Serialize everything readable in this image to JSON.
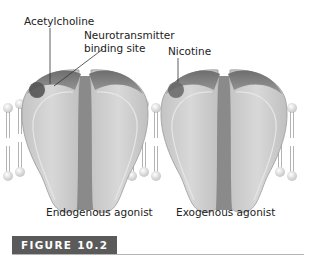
{
  "labels": {
    "acetylcholine": "Acetylcholine",
    "binding_site_line1": "Neurotransmitter",
    "binding_site_line2": "binding site",
    "nicotine": "Nicotine"
  },
  "captions": {
    "left": "Endogenous agonist",
    "right": "Exogenous agonist"
  },
  "figure": {
    "label": "FIGURE 10.2"
  },
  "colors": {
    "receptor_body": "#cfcfcf",
    "receptor_cap": "#7a7a7a",
    "ligand": "#555555",
    "membrane_head": "#e0e0e0",
    "badge_bg": "#5a5a5a"
  }
}
